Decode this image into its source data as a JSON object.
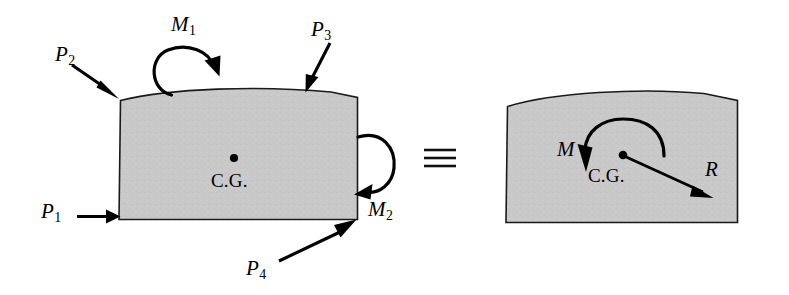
{
  "figure": {
    "equivalence_symbol": "≡",
    "colors": {
      "body_fill": "#c9c9c9",
      "body_stroke": "#1a1a1a",
      "arrow": "#000000",
      "background": "#ffffff"
    }
  },
  "left_body": {
    "name": "rigid body with applied loads",
    "center_of_gravity_label": "C.G.",
    "loads": [
      {
        "id": "P1",
        "label": "P",
        "subscript": "1",
        "kind": "force",
        "direction": "right",
        "applied_at": "bottom-left corner"
      },
      {
        "id": "P2",
        "label": "P",
        "subscript": "2",
        "kind": "force",
        "direction": "down-right",
        "applied_at": "top-left corner"
      },
      {
        "id": "P3",
        "label": "P",
        "subscript": "3",
        "kind": "force",
        "direction": "down-left",
        "applied_at": "top surface, right of crown"
      },
      {
        "id": "P4",
        "label": "P",
        "subscript": "4",
        "kind": "force",
        "direction": "up-right",
        "applied_at": "bottom-right corner"
      },
      {
        "id": "M1",
        "label": "M",
        "subscript": "1",
        "kind": "moment",
        "sense": "clockwise",
        "applied_at": "top surface, left of crown"
      },
      {
        "id": "M2",
        "label": "M",
        "subscript": "2",
        "kind": "moment",
        "sense": "clockwise",
        "applied_at": "right edge"
      }
    ]
  },
  "right_body": {
    "name": "equivalent rigid body with resultant force and couple",
    "center_of_gravity_label": "C.G.",
    "loads": [
      {
        "id": "M",
        "label": "M",
        "subscript": "",
        "kind": "moment",
        "sense": "counterclockwise",
        "applied_at": "center of gravity"
      },
      {
        "id": "R",
        "label": "R",
        "subscript": "",
        "kind": "force",
        "direction": "down-right",
        "applied_at": "center of gravity"
      }
    ]
  }
}
